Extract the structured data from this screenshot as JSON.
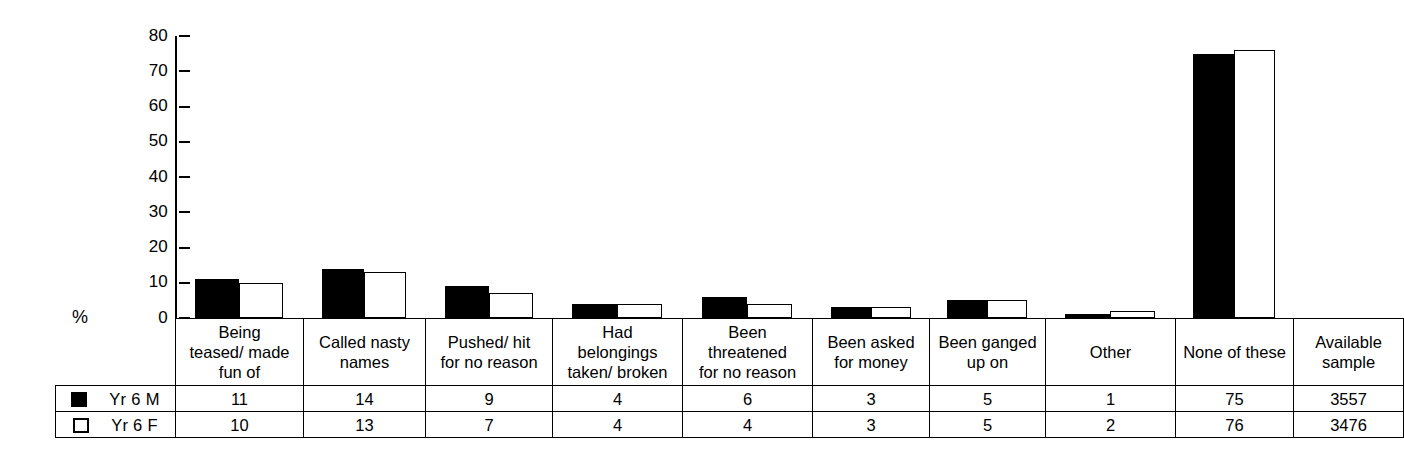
{
  "axis": {
    "y_label": "%",
    "ticks": [
      80,
      70,
      60,
      50,
      40,
      30,
      20,
      10,
      0
    ]
  },
  "legend": [
    {
      "key": "m",
      "label": "Yr 6 M",
      "swatch": "filled-square-black"
    },
    {
      "key": "f",
      "label": "Yr 6 F",
      "swatch": "hollow-square-white"
    }
  ],
  "table": {
    "row_header_labels": [
      "Yr 6 M",
      "Yr 6 F"
    ],
    "columns": [
      {
        "lines": [
          "Being",
          "teased/ made",
          "fun of"
        ]
      },
      {
        "lines": [
          "Called nasty",
          "names"
        ]
      },
      {
        "lines": [
          "Pushed/ hit",
          "for no reason"
        ]
      },
      {
        "lines": [
          "Had",
          "belongings",
          "taken/ broken"
        ]
      },
      {
        "lines": [
          "Been",
          "threatened",
          "for no reason"
        ]
      },
      {
        "lines": [
          "Been asked",
          "for money"
        ]
      },
      {
        "lines": [
          "Been ganged",
          "up on"
        ]
      },
      {
        "lines": [
          "Other"
        ]
      },
      {
        "lines": [
          "None of these"
        ]
      },
      {
        "lines": [
          "Available",
          "sample"
        ]
      }
    ],
    "rows": [
      {
        "label": "Yr 6 M",
        "values": [
          "11",
          "14",
          "9",
          "4",
          "6",
          "3",
          "5",
          "1",
          "75",
          "3557"
        ]
      },
      {
        "label": "Yr 6 F",
        "values": [
          "10",
          "13",
          "7",
          "4",
          "4",
          "3",
          "5",
          "2",
          "76",
          "3476"
        ]
      }
    ]
  },
  "chart_data": {
    "type": "bar",
    "title": "",
    "xlabel": "",
    "ylabel": "%",
    "ylim": [
      0,
      80
    ],
    "yticks": [
      0,
      10,
      20,
      30,
      40,
      50,
      60,
      70,
      80
    ],
    "grid": false,
    "legend_position": "table-row-headers",
    "categories": [
      "Being teased/ made fun of",
      "Called nasty names",
      "Pushed/ hit for no reason",
      "Had belongings taken/ broken",
      "Been threatened for no reason",
      "Been asked for money",
      "Been ganged up on",
      "Other",
      "None of these"
    ],
    "series": [
      {
        "name": "Yr 6 M",
        "color": "#000000",
        "values": [
          11,
          14,
          9,
          4,
          6,
          3,
          5,
          1,
          75
        ]
      },
      {
        "name": "Yr 6 F",
        "color": "#ffffff",
        "values": [
          10,
          13,
          7,
          4,
          4,
          3,
          5,
          2,
          76
        ]
      }
    ],
    "available_sample": {
      "Yr 6 M": 3557,
      "Yr 6 F": 3476
    }
  }
}
